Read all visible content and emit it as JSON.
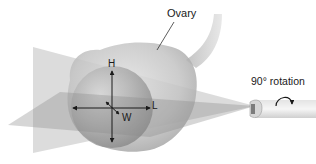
{
  "figure": {
    "labels": {
      "ovary": "Ovary",
      "rotation": "90° rotation",
      "height": "H",
      "length": "L",
      "width": "W"
    },
    "colors": {
      "background": "#ffffff",
      "ovary_outer": "#b9b9b9",
      "ovary_inner": "#9c9c9c",
      "plane": "#8f8f8f",
      "arrow": "#1a1a1a"
    }
  }
}
